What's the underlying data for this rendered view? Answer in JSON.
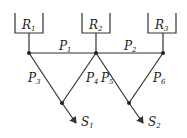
{
  "reservoirs": [
    {
      "id": "R1",
      "letter": "R",
      "sub": "1"
    },
    {
      "id": "R2",
      "letter": "R",
      "sub": "2"
    },
    {
      "id": "R3",
      "letter": "R",
      "sub": "3"
    }
  ],
  "pipes": [
    {
      "id": "P1",
      "letter": "P",
      "sub": "1"
    },
    {
      "id": "P2",
      "letter": "P",
      "sub": "2"
    },
    {
      "id": "P3",
      "letter": "P",
      "sub": "3"
    },
    {
      "id": "P4",
      "letter": "P",
      "sub": "4"
    },
    {
      "id": "P5",
      "letter": "P",
      "sub": "5"
    },
    {
      "id": "P6",
      "letter": "P",
      "sub": "6"
    }
  ],
  "sinks": [
    {
      "id": "S1",
      "letter": "S",
      "sub": "1"
    },
    {
      "id": "S2",
      "letter": "S",
      "sub": "2"
    }
  ],
  "colors": {
    "line": "#333333",
    "background": "#ffffff"
  }
}
